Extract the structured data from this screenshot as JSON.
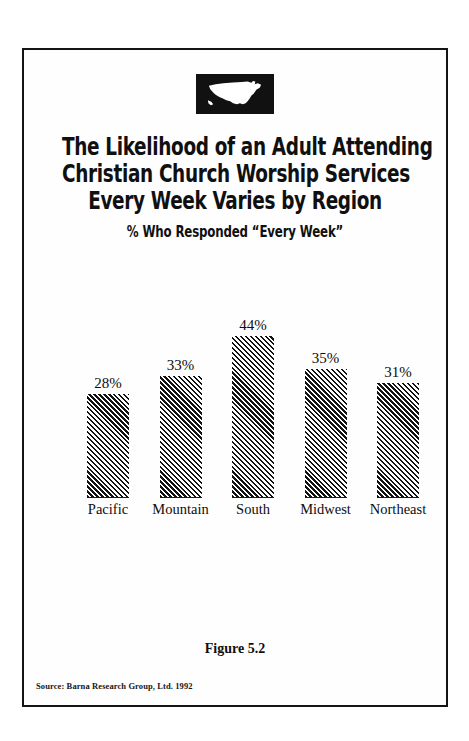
{
  "page": {
    "background": "#ffffff",
    "border_color": "#141414"
  },
  "logo": {
    "icon": "usa-map-icon",
    "background": "#111111",
    "shape_color": "#ffffff"
  },
  "title": {
    "lines": [
      "The Likelihood of an Adult Attending",
      "Christian Church Worship Services",
      "Every Week Varies by Region"
    ],
    "subtitle": "% Who Responded “Every Week”"
  },
  "footer": {
    "figure_caption": "Figure 5.2",
    "source": "Source: Barna Research Group, Ltd. 1992"
  },
  "chart_data": {
    "type": "bar",
    "title": "The Likelihood of an Adult Attending Christian Church Worship Services Every Week Varies by Region",
    "subtitle": "% Who Responded “Every Week”",
    "categories": [
      "Pacific",
      "Mountain",
      "South",
      "Midwest",
      "Northeast"
    ],
    "values": [
      28,
      33,
      44,
      35,
      31
    ],
    "value_labels": [
      "28%",
      "33%",
      "44%",
      "35%",
      "31%"
    ],
    "xlabel": "",
    "ylabel": "",
    "ylim": [
      0,
      48
    ],
    "grid": false,
    "legend": "none",
    "bar_fill": "diagonal-hatch",
    "bar_color": "#121212",
    "source": "Source: Barna Research Group, Ltd. 1992",
    "figure_number": "Figure 5.2"
  }
}
